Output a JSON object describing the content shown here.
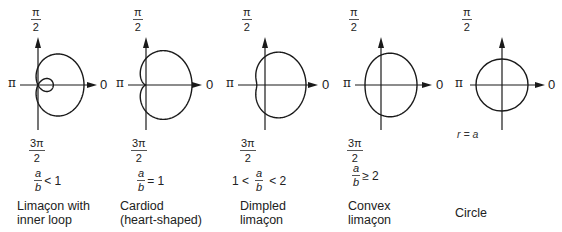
{
  "figure": {
    "axis_labels": {
      "top_num": "π",
      "top_den": "2",
      "bottom_num": "3π",
      "bottom_den": "2",
      "left": "π",
      "right": "0"
    },
    "panels": [
      {
        "id": "inner-loop",
        "name_line1": "Limaçon with",
        "name_line2": "inner loop",
        "condition": {
          "prefix": "",
          "num": "a",
          "den": "b",
          "suffix": "< 1"
        },
        "a_over_b": 0.5
      },
      {
        "id": "cardioid",
        "name_line1": "Cardiod",
        "name_line2": "(heart-shaped)",
        "condition": {
          "prefix": "",
          "num": "a",
          "den": "b",
          "suffix": "= 1"
        },
        "a_over_b": 1.0
      },
      {
        "id": "dimpled",
        "name_line1": "Dimpled",
        "name_line2": "limaçon",
        "condition": {
          "prefix": "1 <",
          "num": "a",
          "den": "b",
          "suffix": "< 2"
        },
        "a_over_b": 1.5
      },
      {
        "id": "convex",
        "name_line1": "Convex",
        "name_line2": "limaçon",
        "condition": {
          "prefix": "",
          "num": "a",
          "den": "b",
          "suffix": "≥ 2"
        },
        "a_over_b": 2.6
      },
      {
        "id": "circle",
        "name_line1": "Circle",
        "name_line2": "",
        "condition": {
          "prefix": "",
          "num": "",
          "den": "",
          "suffix": ""
        },
        "equation_label": "r = a"
      }
    ]
  }
}
